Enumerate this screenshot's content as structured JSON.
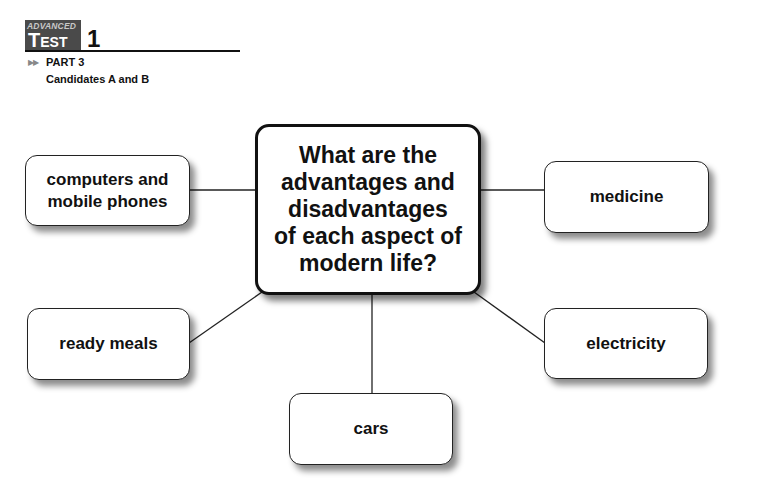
{
  "header": {
    "level": "ADVANCED",
    "test_word_first": "T",
    "test_word_rest": "EST",
    "test_number": "1",
    "part_arrows": "▶▶",
    "part": "PART 3",
    "candidates": "Candidates A and B"
  },
  "diagram": {
    "central_question": "What are the\nadvantages and\ndisadvantages\nof each aspect of\nmodern life?",
    "topics": {
      "computers": "computers and\nmobile phones",
      "medicine": "medicine",
      "ready_meals": "ready meals",
      "electricity": "electricity",
      "cars": "cars"
    }
  }
}
